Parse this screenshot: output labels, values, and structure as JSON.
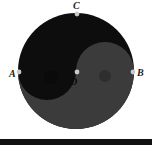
{
  "figure": {
    "name": "taijitu-diagram",
    "background_color": "#ffffff"
  },
  "colors": {
    "yin_dark": "#0d0d0d",
    "yang_gray": "#3b3b3b",
    "small_dot_dark": "#0a0a0a",
    "small_dot_light": "#2e2e2e",
    "marker_dot": "#c9c9c9",
    "label_text": "#1b1b1b",
    "rule": "#111111"
  },
  "circle": {
    "center_x": 76,
    "center_y": 71,
    "radius": 58
  },
  "labels": [
    {
      "id": "A",
      "text": "A",
      "x": 9,
      "y": 69,
      "anchor_x": 19,
      "anchor_y": 72
    },
    {
      "id": "B",
      "text": "B",
      "x": 137,
      "y": 68,
      "anchor_x": 133,
      "anchor_y": 72
    },
    {
      "id": "C",
      "text": "C",
      "x": 73,
      "y": 1,
      "anchor_x": 77,
      "anchor_y": 14
    },
    {
      "id": "D",
      "text": "D",
      "x": 70,
      "y": 77,
      "anchor_x": 77,
      "anchor_y": 72
    }
  ],
  "markers": [
    {
      "id": "marker-A",
      "cx": 19,
      "cy": 72
    },
    {
      "id": "marker-B",
      "cx": 133,
      "cy": 72
    },
    {
      "id": "marker-C",
      "cx": 77,
      "cy": 14
    },
    {
      "id": "marker-D",
      "cx": 77,
      "cy": 72
    }
  ],
  "eyes": [
    {
      "id": "yin-eye",
      "cx": 51,
      "cy": 77,
      "r": 7,
      "fill": "#0a0a0a"
    },
    {
      "id": "yang-eye",
      "cx": 105,
      "cy": 76,
      "r": 6,
      "fill": "#2e2e2e"
    }
  ],
  "bottom_rule": {
    "x": 0,
    "y": 139,
    "width": 152,
    "height": 6
  }
}
